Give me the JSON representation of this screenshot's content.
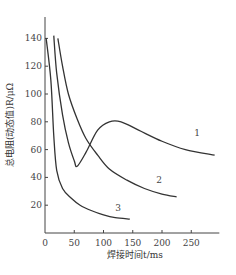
{
  "chart_data": {
    "type": "line",
    "title": "",
    "xlabel": "焊接时间t/ms",
    "ylabel": "总电阻(动态值)R/μΩ",
    "xlim": [
      0,
      300
    ],
    "ylim": [
      0,
      160
    ],
    "x_ticks": [
      "0",
      "50",
      "100",
      "150",
      "200",
      "250"
    ],
    "y_ticks": [
      "20",
      "40",
      "60",
      "80",
      "100",
      "120",
      "140"
    ],
    "grid": false,
    "legend": "inline curve labels",
    "series": [
      {
        "name": "1",
        "x": [
          15,
          20,
          30,
          40,
          50,
          55,
          70,
          90,
          110,
          130,
          160,
          200,
          240,
          290
        ],
        "y": [
          142,
          115,
          85,
          65,
          52,
          48,
          58,
          74,
          80,
          80,
          74,
          66,
          60,
          56
        ]
      },
      {
        "name": "2",
        "x": [
          22,
          30,
          40,
          55,
          70,
          90,
          110,
          140,
          170,
          200,
          225
        ],
        "y": [
          140,
          120,
          100,
          82,
          68,
          56,
          46,
          38,
          32,
          28,
          26
        ]
      },
      {
        "name": "3",
        "x": [
          2,
          10,
          15,
          20,
          30,
          45,
          60,
          80,
          100,
          120,
          145
        ],
        "y": [
          140,
          110,
          70,
          45,
          32,
          25,
          20,
          16,
          13,
          11,
          10
        ]
      }
    ],
    "curve_labels": [
      {
        "text": "1",
        "x": 255,
        "y": 70
      },
      {
        "text": "2",
        "x": 190,
        "y": 36
      },
      {
        "text": "3",
        "x": 120,
        "y": 16
      }
    ]
  }
}
